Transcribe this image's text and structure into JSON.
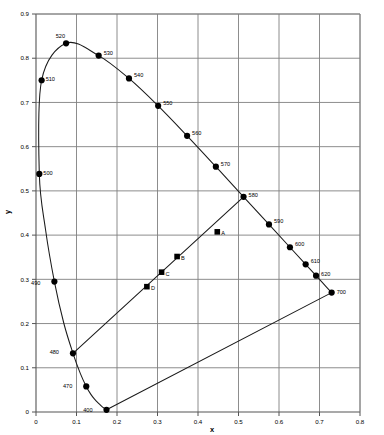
{
  "chart_data": {
    "type": "line",
    "title": "",
    "subtitle": "",
    "xlabel": "x",
    "ylabel": "y",
    "xlim": [
      0,
      0.8
    ],
    "ylim": [
      0,
      0.9
    ],
    "grid": true,
    "legend": "none",
    "xticks": [
      "0",
      "0.1",
      "0.2",
      "0.3",
      "0.4",
      "0.5",
      "0.6",
      "0.7",
      "0.8"
    ],
    "xtick_values": [
      0,
      0.1,
      0.2,
      0.3,
      0.4,
      0.5,
      0.6,
      0.7,
      0.8
    ],
    "yticks": [
      "0",
      "0.1",
      "0.2",
      "0.3",
      "0.4",
      "0.5",
      "0.6",
      "0.7",
      "0.8",
      "0.9"
    ],
    "ytick_values": [
      0,
      0.1,
      0.2,
      0.3,
      0.4,
      0.5,
      0.6,
      0.7,
      0.8,
      0.9
    ],
    "series": [
      {
        "name": "spectral-locus",
        "type": "line",
        "closed": false,
        "points": [
          [
            0.1741,
            0.005
          ],
          [
            0.1644,
            0.0109
          ],
          [
            0.1566,
            0.0177
          ],
          [
            0.144,
            0.0297
          ],
          [
            0.1355,
            0.0399
          ],
          [
            0.1241,
            0.0578
          ],
          [
            0.1096,
            0.0868
          ],
          [
            0.0913,
            0.1327
          ],
          [
            0.0687,
            0.2007
          ],
          [
            0.0454,
            0.295
          ],
          [
            0.0235,
            0.4127
          ],
          [
            0.0082,
            0.5384
          ],
          [
            0.0139,
            0.7502
          ],
          [
            0.0743,
            0.8338
          ],
          [
            0.1547,
            0.8059
          ],
          [
            0.2296,
            0.7543
          ],
          [
            0.3016,
            0.6923
          ],
          [
            0.3731,
            0.6245
          ],
          [
            0.4441,
            0.5547
          ],
          [
            0.5125,
            0.4866
          ],
          [
            0.5752,
            0.4242
          ],
          [
            0.627,
            0.3725
          ],
          [
            0.6658,
            0.334
          ],
          [
            0.6915,
            0.3083
          ],
          [
            0.7079,
            0.292
          ],
          [
            0.719,
            0.2809
          ],
          [
            0.73,
            0.27
          ]
        ]
      },
      {
        "name": "purple-line",
        "type": "line",
        "points": [
          [
            0.1741,
            0.005
          ],
          [
            0.73,
            0.27
          ]
        ]
      },
      {
        "name": "planckian-illuminant-line",
        "type": "line",
        "points": [
          [
            0.0913,
            0.1327
          ],
          [
            0.5125,
            0.4866
          ]
        ]
      }
    ],
    "wavelength_markers": [
      {
        "label": "400",
        "x": 0.1741,
        "y": 0.005,
        "lx": -14,
        "ly": 0
      },
      {
        "label": "470",
        "x": 0.1241,
        "y": 0.0578,
        "lx": -14,
        "ly": 0
      },
      {
        "label": "480",
        "x": 0.0913,
        "y": 0.1327,
        "lx": -14,
        "ly": -1
      },
      {
        "label": "490",
        "x": 0.0454,
        "y": 0.295,
        "lx": -14,
        "ly": 1
      },
      {
        "label": "500",
        "x": 0.0082,
        "y": 0.5384,
        "lx": 4,
        "ly": -1
      },
      {
        "label": "510",
        "x": 0.0139,
        "y": 0.7502,
        "lx": 4,
        "ly": -1
      },
      {
        "label": "520",
        "x": 0.0743,
        "y": 0.8338,
        "lx": -1,
        "ly": -7
      },
      {
        "label": "530",
        "x": 0.1547,
        "y": 0.8059,
        "lx": 5,
        "ly": -3
      },
      {
        "label": "540",
        "x": 0.2296,
        "y": 0.7543,
        "lx": 5,
        "ly": -3
      },
      {
        "label": "550",
        "x": 0.3016,
        "y": 0.6923,
        "lx": 5,
        "ly": -3
      },
      {
        "label": "560",
        "x": 0.3731,
        "y": 0.6245,
        "lx": 5,
        "ly": -3
      },
      {
        "label": "570",
        "x": 0.4441,
        "y": 0.5547,
        "lx": 5,
        "ly": -3
      },
      {
        "label": "580",
        "x": 0.5125,
        "y": 0.4866,
        "lx": 5,
        "ly": -2
      },
      {
        "label": "590",
        "x": 0.5752,
        "y": 0.4242,
        "lx": 5,
        "ly": -3
      },
      {
        "label": "600",
        "x": 0.627,
        "y": 0.3725,
        "lx": 5,
        "ly": -3
      },
      {
        "label": "610",
        "x": 0.6658,
        "y": 0.334,
        "lx": 5,
        "ly": -3
      },
      {
        "label": "620",
        "x": 0.6915,
        "y": 0.3083,
        "lx": 5,
        "ly": -2
      },
      {
        "label": "700",
        "x": 0.73,
        "y": 0.27,
        "lx": 5,
        "ly": -1
      }
    ],
    "illuminant_markers": [
      {
        "label": "A",
        "x": 0.4476,
        "y": 0.4074,
        "lx": 4,
        "ly": 1
      },
      {
        "label": "B",
        "x": 0.3484,
        "y": 0.3516,
        "lx": 4,
        "ly": 1
      },
      {
        "label": "C",
        "x": 0.3101,
        "y": 0.3162,
        "lx": 4,
        "ly": 1
      },
      {
        "label": "D",
        "x": 0.2738,
        "y": 0.2834,
        "lx": 4,
        "ly": 1
      }
    ],
    "colors": {
      "curve": "#1a1a1a",
      "grid": "#808080",
      "axis": "#555555",
      "marker": "#000000",
      "text": "#000000",
      "background": "#ffffff"
    }
  }
}
